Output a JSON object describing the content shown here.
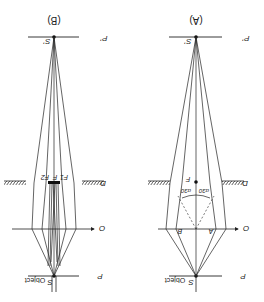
{
  "figure": {
    "orientation": "rotated 180 degrees",
    "panels": [
      {
        "id": "B",
        "label": "(B)",
        "image_point_label": "S'",
        "image_plane_label": "P'",
        "aperture_label": "D",
        "axis_label": "O",
        "object_plane_label": "P",
        "object_label": "S Object",
        "object_point_label": "S",
        "object_text": "Object",
        "focal_labels": [
          "F",
          "F1",
          "F2"
        ]
      },
      {
        "id": "A",
        "label": "(A)",
        "image_point_label": "S'",
        "image_plane_label": "P'",
        "aperture_label": "D",
        "axis_label": "O",
        "object_plane_label": "P",
        "object_label": "S Object",
        "object_point_label": "S",
        "object_text": "Object",
        "focal_label": "F",
        "angle_labels": [
          "α30",
          "α30"
        ],
        "point_labels": [
          "A",
          "B"
        ]
      }
    ]
  },
  "colors": {
    "line": "#222222",
    "background": "#ffffff"
  }
}
